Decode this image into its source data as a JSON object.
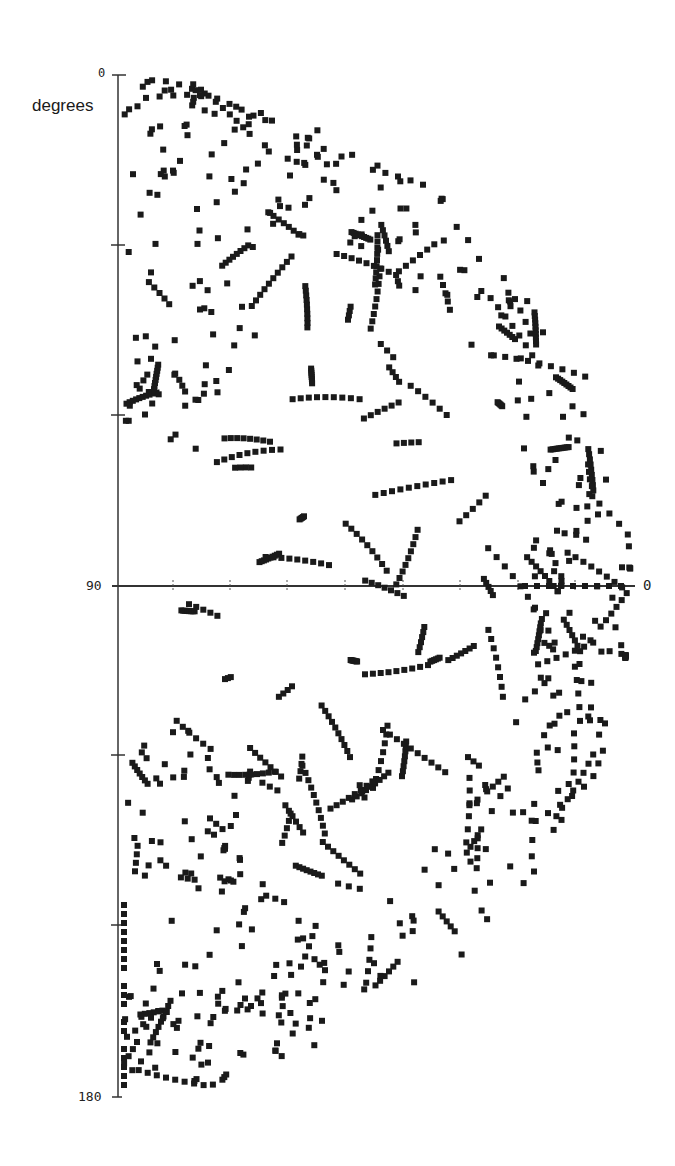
{
  "chart_data": {
    "type": "scatter",
    "subtype": "polar-half-disc",
    "title": "",
    "angle_axis": {
      "label": "degrees",
      "range": [
        0,
        180
      ],
      "tick_labels": [
        "0",
        "90",
        "180"
      ],
      "tick_values": [
        0,
        30,
        60,
        90,
        120,
        150,
        180
      ]
    },
    "radial_axis": {
      "end_label": "0",
      "direction": "increasing toward center (label 0 at outer right end)"
    },
    "marker": {
      "shape": "square",
      "size_px": 6,
      "color": "#1a1a1a"
    },
    "grid": false,
    "legend": null,
    "sample_points_deg_radius": [
      [
        2,
        0.42
      ],
      [
        5,
        0.55
      ],
      [
        8,
        0.7
      ],
      [
        12,
        0.8
      ],
      [
        18,
        0.86
      ],
      [
        25,
        0.9
      ],
      [
        35,
        0.93
      ],
      [
        45,
        0.97
      ],
      [
        55,
        0.95
      ],
      [
        65,
        0.99
      ],
      [
        75,
        0.98
      ],
      [
        85,
        1.0
      ],
      [
        95,
        0.99
      ],
      [
        105,
        0.97
      ],
      [
        115,
        0.96
      ],
      [
        125,
        0.93
      ],
      [
        135,
        0.88
      ],
      [
        145,
        0.82
      ],
      [
        155,
        0.72
      ],
      [
        165,
        0.55
      ],
      [
        172,
        0.4
      ],
      [
        178,
        0.2
      ]
    ]
  },
  "labels": {
    "angle_top": "0",
    "angle_mid": "90",
    "angle_bottom": "180",
    "angle_axis_title": "degrees",
    "radial_end": "0"
  },
  "colors": {
    "marker": "#1a1a1a",
    "axis": "#333333",
    "background": "#ffffff"
  }
}
